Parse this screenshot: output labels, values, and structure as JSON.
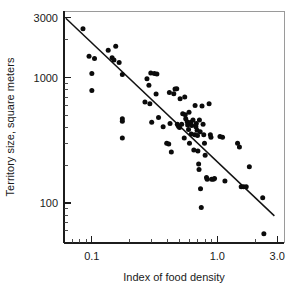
{
  "chart_data": {
    "type": "scatter",
    "title": "",
    "subtitle": "",
    "xlabel": "Index of food density",
    "ylabel": "Territory size, square meters",
    "xscale": "log",
    "yscale": "log",
    "xlim": [
      0.06,
      3.4
    ],
    "ylim": [
      48,
      3400
    ],
    "grid": false,
    "legend": null,
    "x_tick_labels": [
      "0.1",
      "1.0",
      "3.0"
    ],
    "x_tick_values": [
      0.1,
      1.0,
      3.0
    ],
    "x_minor_ticks": [
      0.07,
      0.08,
      0.09,
      0.2,
      0.3,
      0.4,
      0.5,
      0.6,
      0.7,
      0.8,
      0.9,
      2.0,
      3.0
    ],
    "y_tick_labels": [
      "3000",
      "1000",
      "100"
    ],
    "y_tick_values": [
      3000,
      1000,
      100
    ],
    "y_minor_ticks": [
      2000,
      900,
      800,
      700,
      600,
      500,
      400,
      300,
      200,
      90,
      80,
      70,
      60
    ],
    "series": [
      {
        "name": "territories",
        "marker": "filled-circle",
        "color": "#0b0b0b",
        "points": [
          [
            0.085,
            2450
          ],
          [
            0.095,
            1480
          ],
          [
            0.105,
            1420
          ],
          [
            0.1,
            1080
          ],
          [
            0.1,
            790
          ],
          [
            0.135,
            1650
          ],
          [
            0.145,
            1440
          ],
          [
            0.15,
            1380
          ],
          [
            0.155,
            1780
          ],
          [
            0.165,
            1320
          ],
          [
            0.175,
            1060
          ],
          [
            0.175,
            470
          ],
          [
            0.175,
            450
          ],
          [
            0.175,
            330
          ],
          [
            0.265,
            640
          ],
          [
            0.275,
            980
          ],
          [
            0.285,
            870
          ],
          [
            0.29,
            620
          ],
          [
            0.295,
            1090
          ],
          [
            0.3,
            440
          ],
          [
            0.315,
            1080
          ],
          [
            0.325,
            740
          ],
          [
            0.33,
            1070
          ],
          [
            0.34,
            480
          ],
          [
            0.37,
            405
          ],
          [
            0.395,
            300
          ],
          [
            0.41,
            295
          ],
          [
            0.415,
            760
          ],
          [
            0.42,
            430
          ],
          [
            0.43,
            255
          ],
          [
            0.45,
            745
          ],
          [
            0.46,
            810
          ],
          [
            0.475,
            815
          ],
          [
            0.48,
            425
          ],
          [
            0.49,
            410
          ],
          [
            0.5,
            400
          ],
          [
            0.505,
            680
          ],
          [
            0.52,
            425
          ],
          [
            0.53,
            515
          ],
          [
            0.545,
            330
          ],
          [
            0.55,
            700
          ],
          [
            0.555,
            505
          ],
          [
            0.56,
            470
          ],
          [
            0.575,
            445
          ],
          [
            0.58,
            420
          ],
          [
            0.59,
            385
          ],
          [
            0.595,
            530
          ],
          [
            0.6,
            300
          ],
          [
            0.615,
            440
          ],
          [
            0.62,
            355
          ],
          [
            0.625,
            415
          ],
          [
            0.64,
            460
          ],
          [
            0.65,
            265
          ],
          [
            0.66,
            350
          ],
          [
            0.665,
            600
          ],
          [
            0.675,
            405
          ],
          [
            0.68,
            430
          ],
          [
            0.69,
            380
          ],
          [
            0.695,
            345
          ],
          [
            0.7,
            260
          ],
          [
            0.71,
            205
          ],
          [
            0.715,
            185
          ],
          [
            0.72,
            460
          ],
          [
            0.73,
            370
          ],
          [
            0.735,
            130
          ],
          [
            0.745,
            92
          ],
          [
            0.755,
            595
          ],
          [
            0.77,
            425
          ],
          [
            0.78,
            350
          ],
          [
            0.79,
            300
          ],
          [
            0.8,
            240
          ],
          [
            0.82,
            160
          ],
          [
            0.83,
            155
          ],
          [
            0.86,
            620
          ],
          [
            0.88,
            350
          ],
          [
            0.89,
            335
          ],
          [
            0.9,
            155
          ],
          [
            0.93,
            155
          ],
          [
            0.95,
            157
          ],
          [
            1.05,
            340
          ],
          [
            1.1,
            335
          ],
          [
            1.15,
            150
          ],
          [
            1.45,
            300
          ],
          [
            1.5,
            280
          ],
          [
            1.55,
            135
          ],
          [
            1.62,
            135
          ],
          [
            1.7,
            135
          ],
          [
            1.8,
            195
          ],
          [
            2.3,
            110
          ],
          [
            2.35,
            57
          ]
        ]
      }
    ],
    "fit_line": {
      "name": "regression-line",
      "x_start": 0.062,
      "y_start": 2980,
      "x_end": 2.85,
      "y_end": 79
    }
  },
  "axes": {
    "x_title": "Index of food density",
    "y_title": "Territory size, square meters",
    "x_ticks": [
      {
        "label": "0.1",
        "value": 0.1
      },
      {
        "label": "1.0",
        "value": 1.0
      },
      {
        "label": "3.0",
        "value": 3.0
      }
    ],
    "y_ticks": [
      {
        "label": "3000",
        "value": 3000
      },
      {
        "label": "1000",
        "value": 1000
      },
      {
        "label": "100",
        "value": 100
      }
    ]
  },
  "colors": {
    "marker": "#0b0b0b",
    "line": "#121212",
    "axis": "#1c1c1c",
    "frame": "#9a9a9a",
    "background": "#ffffff"
  }
}
